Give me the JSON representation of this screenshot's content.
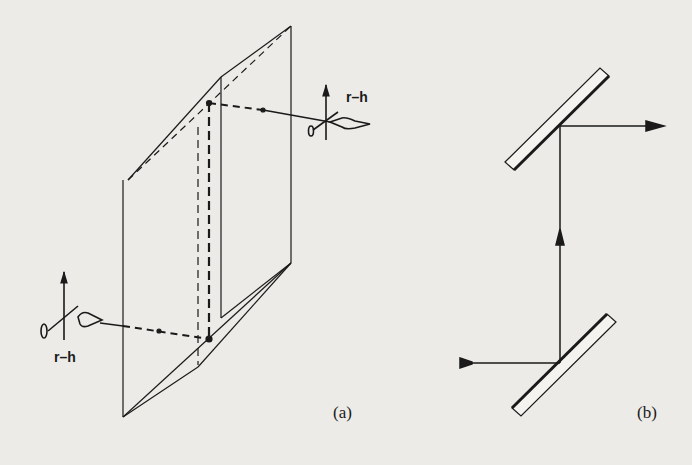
{
  "figure": {
    "panels": [
      {
        "id": "a",
        "label": "(a)",
        "description": "Two parallel inclined reflecting planes (prism-like periscope) with dashed ray path between eye-glyph observers",
        "annotations": [
          {
            "text": "r–h",
            "position": "upper-right observer"
          },
          {
            "text": "r–h",
            "position": "lower-left observer"
          }
        ]
      },
      {
        "id": "b",
        "label": "(b)",
        "description": "Two parallel 45° mirrors (periscope): beam enters from left at bottom mirror, travels up, exits right at top mirror"
      }
    ],
    "colors": {
      "background": "#ecebe7",
      "ink": "#1a1a1a"
    }
  }
}
